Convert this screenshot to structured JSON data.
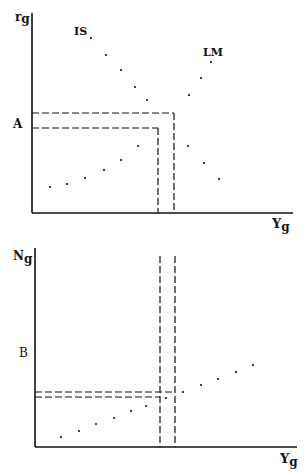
{
  "colors": {
    "ink": "#111111",
    "background": "#ffffff"
  },
  "top_panel": {
    "y_axis_label": "r",
    "y_axis_sub": "g",
    "x_axis_label": "Y",
    "x_axis_sub": "g",
    "curve_labels": {
      "is": "IS",
      "lm": "LM"
    },
    "marker_label": "A",
    "axis": {
      "origin": [
        32,
        213
      ],
      "y_top": 13,
      "x_right": 293
    },
    "dashed_h": [
      {
        "y": 113,
        "x_end": 174
      },
      {
        "y": 128,
        "x_end": 158
      }
    ],
    "dashed_v": [
      {
        "x": 158,
        "y_start": 128
      },
      {
        "x": 174,
        "y_start": 113
      }
    ],
    "dots": [
      [
        91,
        38
      ],
      [
        106,
        55
      ],
      [
        121,
        70
      ],
      [
        135,
        87
      ],
      [
        147,
        100
      ],
      [
        189,
        95
      ],
      [
        201,
        78
      ],
      [
        211,
        62
      ],
      [
        50,
        187
      ],
      [
        67,
        184
      ],
      [
        85,
        178
      ],
      [
        104,
        170
      ],
      [
        121,
        160
      ],
      [
        138,
        146
      ],
      [
        188,
        146
      ],
      [
        204,
        163
      ],
      [
        219,
        179
      ]
    ]
  },
  "bottom_panel": {
    "y_axis_label": "N",
    "y_axis_sub": "g",
    "x_axis_label": "Y",
    "x_axis_sub": "g",
    "marker_label": "B",
    "axis": {
      "origin": [
        35,
        447
      ],
      "y_top": 248,
      "x_right": 297
    },
    "dashed_h": [
      {
        "y": 392,
        "x_end": 175
      },
      {
        "y": 397,
        "x_end": 160
      }
    ],
    "dashed_v": [
      {
        "x": 160,
        "y_start": 256
      },
      {
        "x": 175,
        "y_start": 256
      }
    ],
    "dots": [
      [
        61,
        437
      ],
      [
        79,
        431
      ],
      [
        96,
        424
      ],
      [
        114,
        418
      ],
      [
        131,
        411
      ],
      [
        146,
        406
      ],
      [
        166,
        398
      ],
      [
        183,
        392
      ],
      [
        201,
        385
      ],
      [
        218,
        379
      ],
      [
        236,
        372
      ],
      [
        253,
        365
      ]
    ]
  }
}
